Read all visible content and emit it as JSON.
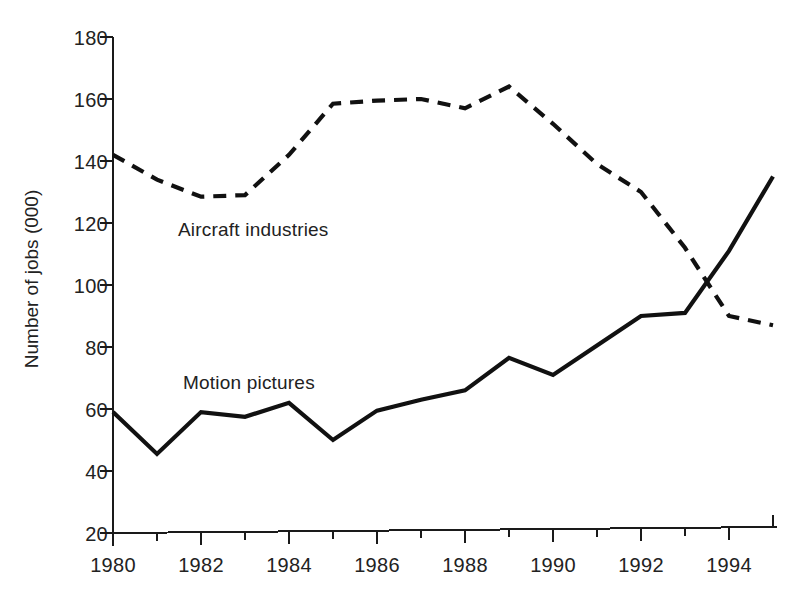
{
  "figure": {
    "background_color": "#ffffff",
    "line_color": "#111111"
  },
  "axes": {
    "y_title": "Number of jobs (000)",
    "y_ticks": [
      "180",
      "160",
      "140",
      "120",
      "100",
      "80",
      "60",
      "40",
      "20"
    ],
    "x_ticks": [
      "1980",
      "1982",
      "1984",
      "1986",
      "1988",
      "1990",
      "1992",
      "1994"
    ]
  },
  "annotations": {
    "aircraft": "Aircraft industries",
    "motion": "Motion pictures"
  },
  "chart_data": {
    "type": "line",
    "title": "",
    "subtitle": "",
    "xlabel": "",
    "ylabel": "Number of jobs (000)",
    "xlim": [
      1980,
      1995
    ],
    "ylim": [
      20,
      180
    ],
    "ytick_values": [
      20,
      40,
      60,
      80,
      100,
      120,
      140,
      160,
      180
    ],
    "xtick_values": [
      1980,
      1982,
      1984,
      1986,
      1988,
      1990,
      1992,
      1994
    ],
    "x_minor_tick_values": [
      1981,
      1983,
      1985,
      1987,
      1989,
      1991,
      1993,
      1995
    ],
    "grid": false,
    "legend": "inline-annotations",
    "x": [
      1980,
      1981,
      1982,
      1983,
      1984,
      1985,
      1986,
      1987,
      1988,
      1989,
      1990,
      1991,
      1992,
      1993,
      1994,
      1995
    ],
    "series": [
      {
        "name": "Aircraft industries",
        "style": "dashed",
        "color": "#111111",
        "values": [
          142,
          134,
          128.5,
          129,
          142,
          158.5,
          159.5,
          160,
          157,
          164,
          152,
          139,
          130,
          112,
          90,
          87
        ]
      },
      {
        "name": "Motion pictures",
        "style": "solid",
        "color": "#111111",
        "values": [
          59,
          45.5,
          59,
          57.5,
          62,
          50,
          59.5,
          63,
          66,
          76.5,
          71,
          80.5,
          90,
          91,
          111,
          135
        ]
      }
    ]
  }
}
